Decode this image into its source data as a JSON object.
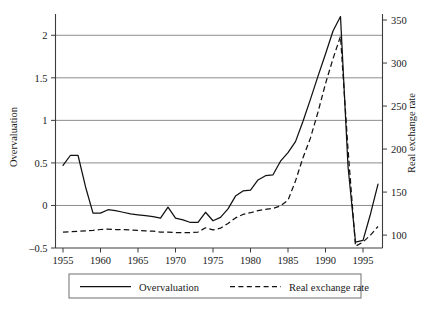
{
  "chart_data": {
    "type": "line",
    "title": "",
    "xlabel": "",
    "ylabel": "Overvaluation",
    "y2label": "Real exchange rate",
    "grid": true,
    "legend_position": "bottom",
    "xlim": [
      1954.0,
      1997.6
    ],
    "ylim": [
      -0.5,
      2.25
    ],
    "y2lim": [
      85.0,
      357.0
    ],
    "xticks": [
      1955,
      1960,
      1965,
      1970,
      1975,
      1980,
      1985,
      1990,
      1995
    ],
    "xtick_labels": [
      "1955",
      "1960",
      "1965",
      "1970",
      "1975",
      "1980",
      "1985",
      "1990",
      "1995"
    ],
    "yticks": [
      -0.5,
      0,
      0.5,
      1,
      1.5,
      2
    ],
    "ytick_labels": [
      "–0.5",
      "0",
      "0.5",
      "1",
      "1.5",
      "2"
    ],
    "y2ticks": [
      100,
      150,
      200,
      250,
      300,
      350
    ],
    "y2tick_labels": [
      "100",
      "150",
      "200",
      "250",
      "300",
      "350"
    ],
    "series": [
      {
        "name": "Overvaluation",
        "style": "solid",
        "axis": "left",
        "x": [
          1955,
          1956,
          1957,
          1958,
          1959,
          1960,
          1961,
          1962,
          1963,
          1964,
          1965,
          1966,
          1967,
          1968,
          1969,
          1970,
          1971,
          1972,
          1973,
          1974,
          1975,
          1976,
          1977,
          1978,
          1979,
          1980,
          1981,
          1982,
          1983,
          1984,
          1985,
          1986,
          1987,
          1988,
          1989,
          1990,
          1991,
          1992,
          1993,
          1994,
          1995,
          1996,
          1997
        ],
        "values": [
          0.47,
          0.59,
          0.59,
          0.22,
          -0.09,
          -0.09,
          -0.05,
          -0.06,
          -0.08,
          -0.1,
          -0.11,
          -0.12,
          -0.13,
          -0.15,
          -0.02,
          -0.15,
          -0.17,
          -0.2,
          -0.2,
          -0.08,
          -0.18,
          -0.14,
          -0.04,
          0.11,
          0.17,
          0.18,
          0.3,
          0.35,
          0.36,
          0.52,
          0.62,
          0.75,
          0.99,
          1.25,
          1.52,
          1.78,
          2.05,
          2.22,
          0.46,
          -0.43,
          -0.41,
          -0.1,
          0.25
        ]
      },
      {
        "name": "Real exchange rate",
        "style": "dashed",
        "axis": "right",
        "x": [
          1955,
          1956,
          1957,
          1958,
          1959,
          1960,
          1961,
          1962,
          1963,
          1964,
          1965,
          1966,
          1967,
          1968,
          1969,
          1970,
          1971,
          1972,
          1973,
          1974,
          1975,
          1976,
          1977,
          1978,
          1979,
          1980,
          1981,
          1982,
          1983,
          1984,
          1985,
          1986,
          1987,
          1988,
          1989,
          1990,
          1991,
          1992,
          1993,
          1994,
          1995,
          1996,
          1997
        ],
        "values": [
          103.5,
          104.0,
          104.5,
          105.0,
          105.5,
          106.5,
          107.0,
          106.5,
          106.5,
          106.0,
          105.5,
          105.0,
          104.5,
          103.5,
          103.5,
          103.0,
          103.0,
          103.0,
          103.5,
          108.5,
          106.0,
          108.0,
          113.5,
          120.0,
          124.0,
          126.0,
          128.5,
          130.0,
          131.0,
          134.0,
          140.5,
          163.0,
          190.0,
          213.0,
          243.0,
          276.0,
          305.0,
          331.0,
          200.0,
          87.0,
          92.0,
          100.0,
          110.0
        ]
      }
    ],
    "legend": [
      {
        "label": "Overvaluation",
        "style": "solid"
      },
      {
        "label": "Real exchange rate",
        "style": "dashed"
      }
    ]
  }
}
